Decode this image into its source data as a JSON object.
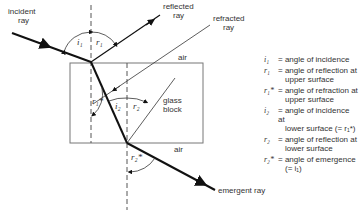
{
  "labels": {
    "incident_ray": "incident\nray",
    "incident_line1": "incident",
    "incident_line2": "ray",
    "reflected_line1": "reflected",
    "reflected_line2": "ray",
    "refracted_line1": "refracted",
    "refracted_line2": "ray",
    "air_top": "air",
    "air_bottom": "air",
    "glass_line1": "glass",
    "glass_line2": "block",
    "emergent_ray": "emergent ray",
    "angle_i1": "i₁",
    "angle_r1": "r₁",
    "angle_r1star": "r₁*",
    "angle_i2": "i₂",
    "angle_r2": "r₂",
    "angle_r2star": "r₂*"
  },
  "legend": [
    {
      "symbol": "i₁",
      "line1": "= angle of incidence",
      "line2": ""
    },
    {
      "symbol": "r₁",
      "line1": "= angle of reflection at",
      "line2": "upper surface"
    },
    {
      "symbol": "r₁*",
      "line1": "= angle of refraction at",
      "line2": "upper surface"
    },
    {
      "symbol": "i₂",
      "line1": "= angle of incidence at",
      "line2": "lower surface (= r₁*)"
    },
    {
      "symbol": "r₂",
      "line1": "= angle of reflection at",
      "line2": "lower surface"
    },
    {
      "symbol": "r₂*",
      "line1": "= angle of emergence",
      "line2": "(= i₁)"
    }
  ]
}
